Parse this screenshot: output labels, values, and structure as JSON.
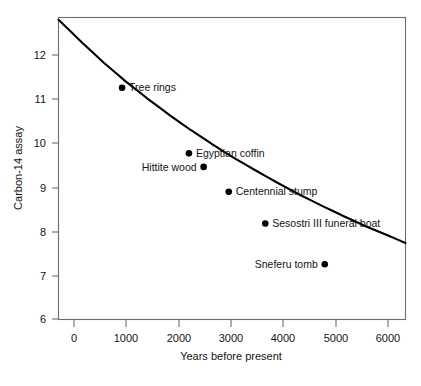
{
  "chart_data": {
    "type": "scatter",
    "title": "",
    "xlabel": "Years before present",
    "ylabel": "Carbon-14 assay",
    "xlim": [
      -130,
      6230
    ],
    "ylim": [
      5.88,
      12.55
    ],
    "grid": false,
    "legend": "none",
    "xticks": [
      0,
      1000,
      2000,
      3000,
      4000,
      5000,
      6000
    ],
    "xtick_labels": [
      "0",
      "1000",
      "2000",
      "3000",
      "4000",
      "5000",
      "6000"
    ],
    "yticks": [
      6,
      7,
      8,
      9,
      10,
      11,
      12
    ],
    "ytick_labels": [
      "6",
      "7",
      "8",
      "9",
      "10",
      "11",
      "12"
    ],
    "points": [
      {
        "label": "Tree rings",
        "x": 1035,
        "y": 11.0,
        "label_side": "right"
      },
      {
        "label": "Egyptian coffin",
        "x": 2260,
        "y": 9.55,
        "label_side": "right"
      },
      {
        "label": "Hittite wood",
        "x": 2530,
        "y": 9.25,
        "label_side": "left"
      },
      {
        "label": "Centennial stump",
        "x": 2990,
        "y": 8.7,
        "label_side": "right"
      },
      {
        "label": "Sesostri III funeral boat",
        "x": 3660,
        "y": 8.0,
        "label_side": "right"
      },
      {
        "label": "Sneferu tomb",
        "x": 4750,
        "y": 7.1,
        "label_side": "left"
      }
    ],
    "curve": {
      "description": "radiocarbon exponential decay curve",
      "x": [
        -130,
        300,
        700,
        1100,
        1500,
        1900,
        2300,
        2700,
        3100,
        3500,
        3900,
        4300,
        4700,
        5100,
        5500,
        5900,
        6230
      ],
      "y": [
        12.5,
        12.0,
        11.55,
        11.14,
        10.76,
        10.4,
        10.06,
        9.74,
        9.44,
        9.16,
        8.89,
        8.63,
        8.39,
        8.16,
        7.94,
        7.74,
        7.57
      ]
    }
  },
  "axes": {
    "x_title": "Years before present",
    "y_title": "Carbon-14 assay"
  }
}
